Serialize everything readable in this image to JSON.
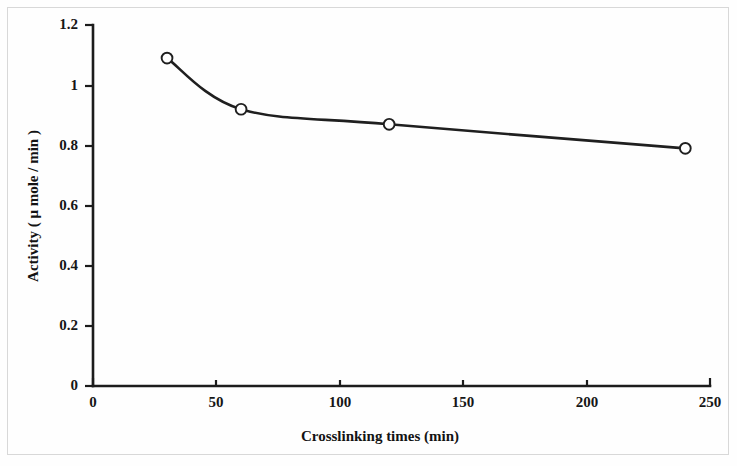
{
  "chart_data": {
    "type": "line",
    "title": "",
    "subtitle": "",
    "xlabel": "Crosslinking times (min)",
    "ylabel": "Activity ( μ mole / min )",
    "x": [
      30,
      60,
      120,
      240
    ],
    "values": [
      1.09,
      0.92,
      0.87,
      0.79
    ],
    "series": [
      {
        "name": "Activity",
        "x": [
          30,
          60,
          120,
          240
        ],
        "values": [
          1.09,
          0.92,
          0.87,
          0.79
        ],
        "marker": "open-circle",
        "line_style": "smooth-solid",
        "color": "#1f1f1f"
      }
    ],
    "xlim": [
      0,
      250
    ],
    "ylim": [
      0,
      1.2
    ],
    "xticks": [
      0,
      50,
      100,
      150,
      200,
      250
    ],
    "yticks": [
      0,
      0.2,
      0.4,
      0.6,
      0.8,
      1,
      1.2
    ],
    "xtick_labels": [
      "0",
      "50",
      "100",
      "150",
      "200",
      "250"
    ],
    "ytick_labels": [
      "0",
      "0.2",
      "0.4",
      "0.6",
      "0.8",
      "1",
      "1.2"
    ],
    "grid": false,
    "legend": false,
    "legend_position": "none",
    "annotations": []
  },
  "figure": {
    "background_color": "#fefefe",
    "border_color": "#d8d8d8",
    "axis_color": "#1c1c1c",
    "series_color": "#1f1f1f",
    "marker_fill": "#ffffff"
  }
}
